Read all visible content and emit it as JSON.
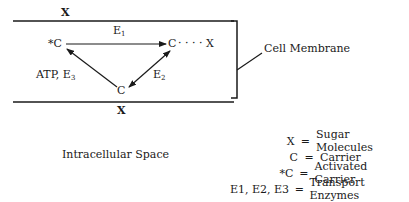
{
  "diagram": {
    "top_label": "X",
    "bottom_label": "X",
    "activated_carrier": "*C",
    "carrier_right": "C",
    "carrier_bottom": "C",
    "dots_x": "· · · · X",
    "enzyme_top": {
      "base": "E",
      "sub": "1"
    },
    "enzyme_right": {
      "base": "E",
      "sub": "2"
    },
    "enzyme_left": {
      "prefix": "ATP, ",
      "base": "E",
      "sub": "3"
    },
    "membrane_label": "Cell Membrane",
    "intracellular_label": "Intracellular Space"
  },
  "legend": [
    {
      "key": "X",
      "eq": "=",
      "value": "Sugar Molecules"
    },
    {
      "key": "C",
      "eq": "=",
      "value": "Carrier"
    },
    {
      "key": "*C",
      "eq": "=",
      "value": "Activated Carrier"
    },
    {
      "key": "E1, E2, E3",
      "eq": "=",
      "value": "Transport Enzymes"
    }
  ],
  "colors": {
    "ink": "#1a1a1a",
    "background": "#ffffff"
  }
}
